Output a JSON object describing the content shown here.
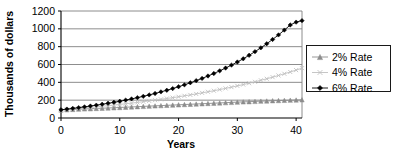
{
  "chart_data": {
    "type": "line",
    "title": "",
    "xlabel": "Years",
    "ylabel": "Thousands of dollars",
    "xlim": [
      0,
      41
    ],
    "ylim": [
      0,
      1200
    ],
    "xticks": [
      0,
      10,
      20,
      30,
      40
    ],
    "yticks": [
      0,
      200,
      400,
      600,
      800,
      1000,
      1200
    ],
    "grid": "horizontal",
    "legend_position": "right",
    "x": [
      0,
      1,
      2,
      3,
      4,
      5,
      6,
      7,
      8,
      9,
      10,
      11,
      12,
      13,
      14,
      15,
      16,
      17,
      18,
      19,
      20,
      21,
      22,
      23,
      24,
      25,
      26,
      27,
      28,
      29,
      30,
      31,
      32,
      33,
      34,
      35,
      36,
      37,
      38,
      39,
      40,
      41
    ],
    "series": [
      {
        "name": "2% Rate",
        "marker": "triangle",
        "color": "#8c8c8c",
        "values": [
          90,
          93,
          96,
          99,
          102,
          104,
          107,
          110,
          112,
          115,
          118,
          121,
          124,
          127,
          130,
          133,
          136,
          139,
          142,
          145,
          148,
          151,
          154,
          157,
          160,
          163,
          166,
          169,
          172,
          175,
          178,
          181,
          183,
          186,
          189,
          191,
          194,
          196,
          198,
          200,
          202,
          204
        ]
      },
      {
        "name": "4% Rate",
        "marker": "cross",
        "color": "#bfbfbf",
        "values": [
          90,
          96,
          101,
          107,
          113,
          119,
          125,
          132,
          138,
          145,
          152,
          160,
          167,
          175,
          183,
          192,
          200,
          209,
          219,
          228,
          238,
          249,
          259,
          270,
          282,
          294,
          306,
          319,
          332,
          346,
          360,
          375,
          390,
          406,
          423,
          440,
          458,
          477,
          496,
          516,
          537,
          559
        ]
      },
      {
        "name": "6% Rate",
        "marker": "diamond",
        "color": "#000000",
        "values": [
          92,
          100,
          108,
          116,
          125,
          134,
          144,
          154,
          165,
          176,
          188,
          201,
          214,
          228,
          243,
          259,
          275,
          293,
          311,
          330,
          351,
          372,
          395,
          419,
          444,
          471,
          499,
          529,
          560,
          593,
          628,
          664,
          703,
          744,
          787,
          833,
          881,
          932,
          986,
          1043,
          1075,
          1092
        ]
      }
    ]
  },
  "legend": {
    "items": [
      {
        "label": "2% Rate"
      },
      {
        "label": "4% Rate"
      },
      {
        "label": "6% Rate"
      }
    ]
  },
  "axes": {
    "y_title": "Thousands of dollars",
    "x_title": "Years",
    "y_tick_labels": [
      "1200",
      "1000",
      "800",
      "600",
      "400",
      "200",
      "0"
    ],
    "x_tick_labels": [
      "0",
      "10",
      "20",
      "30",
      "40"
    ]
  }
}
